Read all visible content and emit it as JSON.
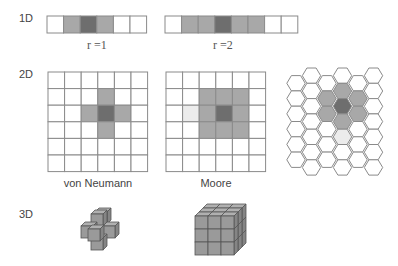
{
  "colors": {
    "center": "#6e6e6e",
    "neighbor": "#a8a8a8",
    "faint": "#ececec",
    "empty": "#ffffff",
    "line": "#8a8a8a",
    "cube_face": "#9a9a9a",
    "cube_top": "#b0b0b0",
    "cube_side": "#858585",
    "cube_edge": "#555555"
  },
  "rows": [
    {
      "label": "1D"
    },
    {
      "label": "2D"
    },
    {
      "label": "3D"
    }
  ],
  "one_d": [
    {
      "radius_label": "r =1",
      "cells": [
        "empty",
        "neighbor",
        "center",
        "neighbor",
        "empty",
        "empty"
      ]
    },
    {
      "radius_label": "r =2",
      "cells": [
        "empty",
        "neighbor",
        "neighbor",
        "center",
        "neighbor",
        "neighbor",
        "empty",
        "empty"
      ]
    }
  ],
  "two_d": {
    "von_neumann": {
      "caption": "von Neumann",
      "size": 6,
      "center": [
        2,
        3
      ],
      "neighbors": [
        [
          1,
          3
        ],
        [
          2,
          2
        ],
        [
          2,
          4
        ],
        [
          3,
          3
        ]
      ],
      "faint": []
    },
    "moore": {
      "caption": "Moore",
      "size": 6,
      "center": [
        2,
        3
      ],
      "neighbors": [
        [
          1,
          2
        ],
        [
          1,
          3
        ],
        [
          1,
          4
        ],
        [
          2,
          2
        ],
        [
          2,
          4
        ],
        [
          3,
          2
        ],
        [
          3,
          3
        ],
        [
          3,
          4
        ]
      ],
      "faint": [
        [
          2,
          1
        ]
      ]
    },
    "hexagonal": {
      "caption": "",
      "columns": 6,
      "center": [
        3,
        2
      ],
      "neighbors": [
        [
          3,
          1
        ],
        [
          3,
          3
        ],
        [
          2,
          1
        ],
        [
          2,
          2
        ],
        [
          4,
          1
        ],
        [
          4,
          2
        ]
      ],
      "faint": [
        [
          3,
          4
        ]
      ]
    }
  },
  "three_d": [
    {
      "name": "von Neumann 3D cross"
    },
    {
      "name": "Moore 3D cube"
    }
  ]
}
